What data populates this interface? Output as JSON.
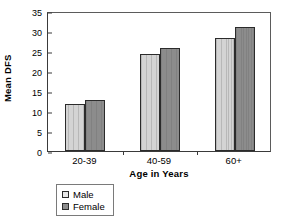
{
  "chart_data": {
    "type": "bar",
    "title": "",
    "xlabel": "Age in Years",
    "ylabel": "Mean DFS",
    "categories": [
      "20-39",
      "40-59",
      "60+"
    ],
    "series": [
      {
        "name": "Male",
        "values": [
          11.8,
          24.2,
          28.3
        ],
        "color": "#d4d4d4"
      },
      {
        "name": "Female",
        "values": [
          12.8,
          25.8,
          31.0
        ],
        "color": "#8c8c8c"
      }
    ],
    "ylim": [
      0,
      35
    ],
    "yticks": [
      0,
      5,
      10,
      15,
      20,
      25,
      30,
      35
    ],
    "ytick_labels": [
      "0",
      "5",
      "10",
      "15",
      "20",
      "25",
      "30",
      "35"
    ],
    "grid": false,
    "legend_position": "bottom-left"
  },
  "legend": {
    "entries": [
      {
        "label": "Male"
      },
      {
        "label": "Female"
      }
    ]
  }
}
